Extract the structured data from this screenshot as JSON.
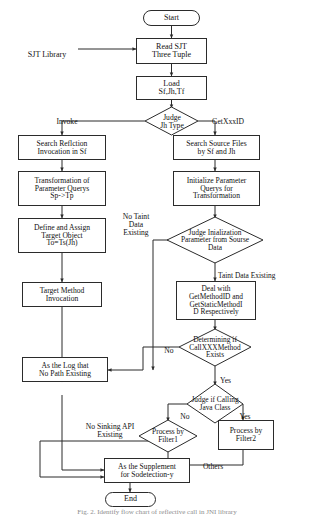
{
  "diagram": {
    "type": "flowchart",
    "nodes": [
      {
        "id": "start",
        "label": "Start",
        "shape": "terminator"
      },
      {
        "id": "read-sjt",
        "label": "Read SJT\nThree Tuple",
        "shape": "process"
      },
      {
        "id": "load",
        "label": "Load\nSf,Jh,Tf",
        "shape": "process"
      },
      {
        "id": "judge-type",
        "label": "Judge\nJh Type",
        "shape": "decision"
      },
      {
        "id": "search-refl",
        "label": "Search Reflction\nInvocation in Sf",
        "shape": "process"
      },
      {
        "id": "transform",
        "label": "Transformation of\nParameter Querys\nSp->Tp",
        "shape": "process"
      },
      {
        "id": "define",
        "label": "Define and Assign\nTarget Object\nTo=Ts(Jh)",
        "shape": "process"
      },
      {
        "id": "target-inv",
        "label": "Target Method\nInvocation",
        "shape": "process"
      },
      {
        "id": "search-src",
        "label": "Search Source Files\nby Sf and Jh",
        "shape": "process"
      },
      {
        "id": "init-param",
        "label": "Initialize Parameter\nQuerys for\nTransformation",
        "shape": "process"
      },
      {
        "id": "judge-init",
        "label": "Judge Inialization\nParameter from Sourse\nData",
        "shape": "decision"
      },
      {
        "id": "deal-with",
        "label": "Deal with\nGetMethodID and\nGetStaticMethodI\nD Respectively",
        "shape": "process"
      },
      {
        "id": "determining",
        "label": "Determining if\nCallXXXMethod\nExists",
        "shape": "decision"
      },
      {
        "id": "as-log",
        "label": "As the Log that\nNo Path Existing",
        "shape": "process"
      },
      {
        "id": "judge-java",
        "label": "Judge if Calling\nJava Class",
        "shape": "decision"
      },
      {
        "id": "filter1",
        "label": "Process by\nFilter1",
        "shape": "decision"
      },
      {
        "id": "filter2",
        "label": "Process by\nFilter2",
        "shape": "process"
      },
      {
        "id": "supplement",
        "label": "As the Supplement\nfor Sodetection-y",
        "shape": "process"
      },
      {
        "id": "end",
        "label": "End",
        "shape": "terminator"
      }
    ],
    "external_labels": [
      {
        "id": "sjt-library",
        "label": "SJT Library"
      }
    ],
    "edge_labels": [
      {
        "id": "invoke",
        "label": "Invoke"
      },
      {
        "id": "getxxxid",
        "label": "GetXxxID"
      },
      {
        "id": "no-taint",
        "label": "No Taint\nData\nExisting"
      },
      {
        "id": "taint-existing",
        "label": "Taint Data Existing"
      },
      {
        "id": "determining-no",
        "label": "No"
      },
      {
        "id": "determining-yes",
        "label": "Yes"
      },
      {
        "id": "java-no",
        "label": "No"
      },
      {
        "id": "java-yes",
        "label": "Yes"
      },
      {
        "id": "no-sinking",
        "label": "No Sinking API\nExisting"
      },
      {
        "id": "others",
        "label": "Others"
      }
    ],
    "caption": "Fig. 2.  Identify flow chart of reflective call in JNI library"
  },
  "colors": {
    "stroke": "#2b2b2b",
    "background": "#ffffff",
    "text": "#111111",
    "caption": "#8d8d8d"
  }
}
